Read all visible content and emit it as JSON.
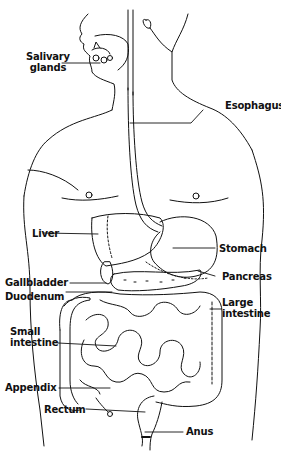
{
  "diagram": {
    "labels": {
      "salivary_glands_1": "Salivary",
      "salivary_glands_2": "glands",
      "esophagus": "Esophagus",
      "liver": "Liver",
      "stomach": "Stomach",
      "gallbladder": "Gallbladder",
      "pancreas": "Pancreas",
      "duodenum": "Duodenum",
      "large_intestine_1": "Large",
      "large_intestine_2": "intestine",
      "small_intestine_1": "Small",
      "small_intestine_2": "intestine",
      "appendix": "Appendix",
      "rectum": "Rectum",
      "anus": "Anus"
    },
    "colors": {
      "ink": "#111111",
      "background": "#ffffff"
    }
  }
}
